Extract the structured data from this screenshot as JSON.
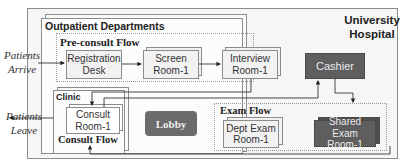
{
  "hospital": {
    "title_line1": "University",
    "title_line2": "Hospital"
  },
  "outpatient": {
    "title": "Outpatient Departments"
  },
  "preconsult": {
    "title": "Pre-consult Flow",
    "registration": {
      "line1": "Registration",
      "line2": "Desk"
    },
    "screen": {
      "line1": "Screen",
      "line2": "Room-1"
    },
    "interview": {
      "line1": "Interview",
      "line2": "Room-1"
    }
  },
  "clinic": {
    "title": "Clinic",
    "consult_room": {
      "line1": "Consult",
      "line2": "Room-1"
    },
    "flow_title": "Consult Flow"
  },
  "lobby": {
    "label": "Lobby"
  },
  "cashier": {
    "label": "Cashier"
  },
  "exam": {
    "title": "Exam Flow",
    "dept_exam": {
      "line1": "Dept Exam",
      "line2": "Room-1"
    },
    "shared_exam": {
      "line1": "Shared Exam",
      "line2": "Room-1"
    }
  },
  "patients_arrive": {
    "line1": "Patients",
    "line2": "Arrive"
  },
  "patients_leave": {
    "line1": "Patients",
    "line2": "Leave"
  },
  "colors": {
    "dark_box": "#5e5e5e",
    "light_box": "#f2f2f2",
    "border": "#8c8c8c"
  }
}
